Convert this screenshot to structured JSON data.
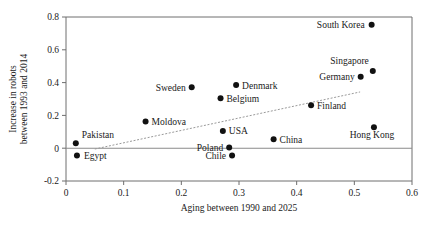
{
  "chart_data": {
    "type": "scatter",
    "title": "",
    "xlabel": "Aging between 1990 and 2025",
    "ylabel": "Increase in robots between 1993 and 2014",
    "ylabel_line1": "Increase in robots",
    "ylabel_line2": "between 1993 and 2014",
    "xlim": [
      0,
      0.6
    ],
    "ylim": [
      -0.2,
      0.8
    ],
    "xticks": [
      0,
      0.1,
      0.2,
      0.3,
      0.4,
      0.5,
      0.6
    ],
    "xtick_labels": [
      "0",
      "0.1",
      "0.2",
      "0.3",
      "0.4",
      "0.5",
      "0.6"
    ],
    "yticks": [
      -0.2,
      0,
      0.2,
      0.4,
      0.6,
      0.8
    ],
    "ytick_labels": [
      "-0.2",
      "0",
      "0.2",
      "0.4",
      "0.6",
      "0.8"
    ],
    "grid": false,
    "legend": "none",
    "zero_line": {
      "y": 0,
      "visible": true
    },
    "trend_line": {
      "style": "dashed",
      "x_start": 0.05,
      "y_start": -0.005,
      "x_end": 0.51,
      "y_end": 0.343
    },
    "points": [
      {
        "label": "Pakistan",
        "x": 0.017,
        "y": 0.03,
        "label_dx": 6,
        "label_dy": -5,
        "anchor": "start"
      },
      {
        "label": "Egypt",
        "x": 0.019,
        "y": -0.045,
        "label_dx": 7,
        "label_dy": 3.5,
        "anchor": "start"
      },
      {
        "label": "Moldova",
        "x": 0.138,
        "y": 0.163,
        "label_dx": 6,
        "label_dy": 3.5,
        "anchor": "start"
      },
      {
        "label": "Sweden",
        "x": 0.218,
        "y": 0.372,
        "label_dx": -6,
        "label_dy": 3.5,
        "anchor": "end"
      },
      {
        "label": "Belgium",
        "x": 0.268,
        "y": 0.305,
        "label_dx": 6,
        "label_dy": 3.5,
        "anchor": "start"
      },
      {
        "label": "Denmark",
        "x": 0.295,
        "y": 0.385,
        "label_dx": 6,
        "label_dy": 3.5,
        "anchor": "start"
      },
      {
        "label": "USA",
        "x": 0.272,
        "y": 0.105,
        "label_dx": 6,
        "label_dy": 3.5,
        "anchor": "start"
      },
      {
        "label": "Poland",
        "x": 0.283,
        "y": 0.005,
        "label_dx": -6,
        "label_dy": 3.5,
        "anchor": "end"
      },
      {
        "label": "Chile",
        "x": 0.288,
        "y": -0.045,
        "label_dx": -6,
        "label_dy": 3.5,
        "anchor": "end"
      },
      {
        "label": "China",
        "x": 0.36,
        "y": 0.055,
        "label_dx": 6,
        "label_dy": 3.5,
        "anchor": "start"
      },
      {
        "label": "Finland",
        "x": 0.425,
        "y": 0.262,
        "label_dx": 6,
        "label_dy": 3.5,
        "anchor": "start"
      },
      {
        "label": "Germany",
        "x": 0.511,
        "y": 0.435,
        "label_dx": -6,
        "label_dy": 3.5,
        "anchor": "end"
      },
      {
        "label": "Singapore",
        "x": 0.532,
        "y": 0.47,
        "label_dx": -4,
        "label_dy": -7,
        "anchor": "end"
      },
      {
        "label": "South Korea",
        "x": 0.53,
        "y": 0.752,
        "label_dx": -7,
        "label_dy": 3.5,
        "anchor": "end"
      },
      {
        "label": "Hong Kong",
        "x": 0.534,
        "y": 0.127,
        "label_dx": -2,
        "label_dy": 11,
        "anchor": "middle"
      }
    ],
    "colors": {
      "point": "#111111",
      "axis": "#6e6e6e",
      "trend": "#9a9a9a",
      "zero": "#8a8a8a",
      "background": "#ffffff"
    }
  }
}
